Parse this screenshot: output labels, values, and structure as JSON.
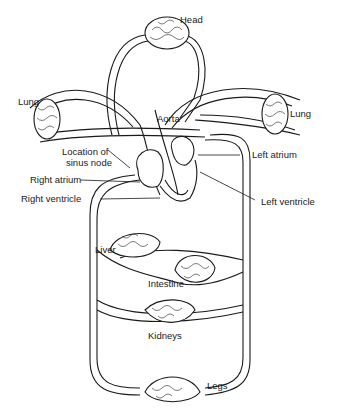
{
  "diagram": {
    "type": "circulatory-system-schematic",
    "labels": {
      "head": "Head",
      "lung_left": "Lung",
      "lung_right": "Lung",
      "aorta": "Aorta",
      "sinus_node_line1": "Location of",
      "sinus_node_line2": "sinus node",
      "left_atrium": "Left atrium",
      "right_atrium": "Right atrium",
      "right_ventricle": "Right ventricle",
      "left_ventricle": "Left ventricle",
      "liver": "Liver",
      "intestine": "Intestine",
      "kidneys": "Kidneys",
      "legs": "Legs"
    },
    "colors": {
      "line": "#1a1a1a",
      "background": "#ffffff"
    }
  }
}
